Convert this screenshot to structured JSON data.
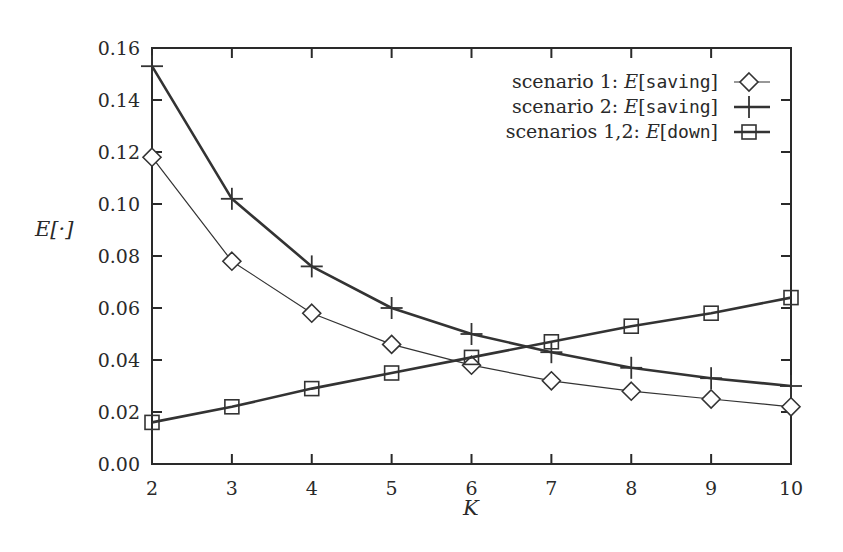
{
  "chart_data": {
    "type": "line",
    "title": "",
    "xlabel": "K",
    "ylabel": "E[·]",
    "x": [
      2,
      3,
      4,
      5,
      6,
      7,
      8,
      9,
      10
    ],
    "xlim": [
      2,
      10
    ],
    "ylim": [
      0.0,
      0.16
    ],
    "x_ticks": [
      "2",
      "3",
      "4",
      "5",
      "6",
      "7",
      "8",
      "9",
      "10"
    ],
    "y_ticks": [
      "0.00",
      "0.02",
      "0.04",
      "0.06",
      "0.08",
      "0.10",
      "0.12",
      "0.14",
      "0.16"
    ],
    "grid": false,
    "legend_position": "top-right",
    "series": [
      {
        "name": "scenario 1: E[saving]",
        "legend_prefix": "scenario 1: ",
        "legend_func": "E",
        "legend_arg": "saving",
        "marker": "diamond",
        "line_width": 1.2,
        "values": [
          0.118,
          0.078,
          0.058,
          0.046,
          0.038,
          0.032,
          0.028,
          0.025,
          0.022
        ]
      },
      {
        "name": "scenario 2: E[saving]",
        "legend_prefix": "scenario 2: ",
        "legend_func": "E",
        "legend_arg": "saving",
        "marker": "plus",
        "line_width": 2.6,
        "values": [
          0.153,
          0.102,
          0.076,
          0.06,
          0.05,
          0.043,
          0.037,
          0.033,
          0.03
        ]
      },
      {
        "name": "scenarios 1,2: E[down]",
        "legend_prefix": "scenarios 1,2: ",
        "legend_func": "E",
        "legend_arg": "down",
        "marker": "square",
        "line_width": 2.6,
        "values": [
          0.016,
          0.022,
          0.029,
          0.035,
          0.041,
          0.047,
          0.053,
          0.058,
          0.064
        ]
      }
    ]
  },
  "colors": {
    "axis": "#2a2a2a",
    "line": "#333333",
    "background": "#ffffff"
  }
}
